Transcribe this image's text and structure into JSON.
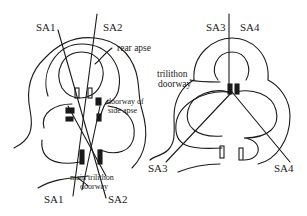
{
  "diagram": {
    "left_plan": {
      "axis_labels_top": [
        "SA1",
        "SA2"
      ],
      "axis_labels_bottom": [
        "SA1",
        "SA2"
      ],
      "annotations": {
        "rear_apse": "rear apse",
        "doorway_side_apse_line1": "doorway of",
        "doorway_side_apse_line2": "side apse",
        "main_trilithon_line1": "main trilithon",
        "main_trilithon_line2": "doorway"
      }
    },
    "right_plan": {
      "axis_labels_top": [
        "SA3",
        "SA4"
      ],
      "axis_labels_bottom": [
        "SA3",
        "SA4"
      ],
      "annotations": {
        "trilithon_line1": "trilithon",
        "trilithon_line2": "doorway"
      }
    },
    "colors": {
      "ink": "#1a1a1a",
      "background": "#ffffff"
    }
  }
}
